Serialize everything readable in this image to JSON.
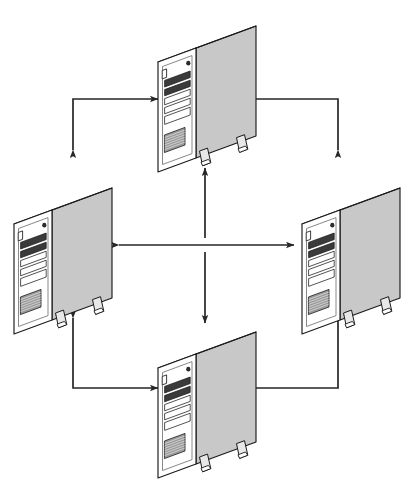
{
  "diagram": {
    "type": "network-topology-diagram",
    "background_color": "#ffffff",
    "canvas": {
      "width": 412,
      "height": 481
    },
    "node_label": "server-tower",
    "node_count": 4,
    "connection_count": 6,
    "colors": {
      "outline": "#1a1a1a",
      "side_panel": "#c8c8c8",
      "top_panel": "#ffffff",
      "front_panel": "#ffffff",
      "bay_fill": "#ffffff",
      "bay_dark": "#3a3a3a",
      "vent_fill": "#9a9a9a",
      "foot_fill": "#e8e8e8",
      "arrow": "#262626"
    },
    "nodes": [
      {
        "id": "top",
        "name": "server-tower-top",
        "x": 152,
        "y": 18,
        "scale": 1.0
      },
      {
        "id": "left",
        "name": "server-tower-left",
        "x": 8,
        "y": 180,
        "scale": 1.0
      },
      {
        "id": "right",
        "name": "server-tower-right",
        "x": 296,
        "y": 180,
        "scale": 1.0
      },
      {
        "id": "bottom",
        "name": "server-tower-bottom",
        "x": 152,
        "y": 324,
        "scale": 1.0
      }
    ],
    "tower_parts": [
      "front-panel",
      "side-panel",
      "top-panel",
      "power-button",
      "status-light",
      "drive-bay-1",
      "drive-bay-2",
      "drive-bay-3",
      "drive-bay-4",
      "drive-bay-5",
      "ventilation-grille",
      "stabilizer-foot-front",
      "stabilizer-foot-rear"
    ],
    "connections": [
      {
        "id": "c1",
        "name": "link-left-to-top",
        "style": "elbow",
        "heads": "both",
        "from": "left",
        "to": "top"
      },
      {
        "id": "c2",
        "name": "link-right-to-top",
        "style": "elbow",
        "heads": "both",
        "from": "right",
        "to": "top"
      },
      {
        "id": "c3",
        "name": "link-left-to-bottom",
        "style": "elbow",
        "heads": "both",
        "from": "left",
        "to": "bottom"
      },
      {
        "id": "c4",
        "name": "link-right-to-bottom",
        "style": "elbow",
        "heads": "both",
        "from": "right",
        "to": "bottom"
      },
      {
        "id": "c5",
        "name": "link-left-right-cross",
        "style": "straight",
        "heads": "both",
        "from": "left",
        "to": "right"
      },
      {
        "id": "c6",
        "name": "link-center-to-top",
        "style": "straight",
        "heads": "end",
        "from": "center",
        "to": "top"
      },
      {
        "id": "c7",
        "name": "link-center-to-bottom",
        "style": "straight",
        "heads": "end",
        "from": "center",
        "to": "bottom"
      }
    ]
  }
}
